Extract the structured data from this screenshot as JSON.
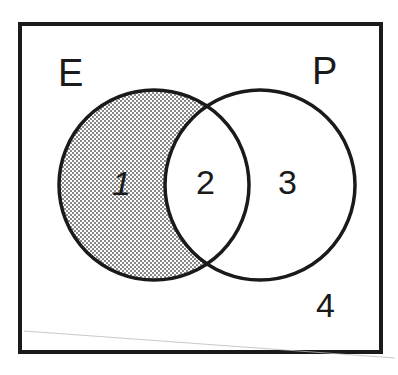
{
  "diagram": {
    "type": "venn",
    "sets": [
      {
        "id": "E",
        "label": "E"
      },
      {
        "id": "P",
        "label": "P"
      }
    ],
    "regions": [
      {
        "id": "1",
        "label": "1",
        "description": "E only",
        "shaded": true
      },
      {
        "id": "2",
        "label": "2",
        "description": "E and P",
        "shaded": false
      },
      {
        "id": "3",
        "label": "3",
        "description": "P only",
        "shaded": false
      },
      {
        "id": "4",
        "label": "4",
        "description": "outside E and P",
        "shaded": false
      }
    ],
    "colors": {
      "stroke": "#1a1a1a",
      "background": "#ffffff",
      "shading_dot": "#555555"
    }
  }
}
